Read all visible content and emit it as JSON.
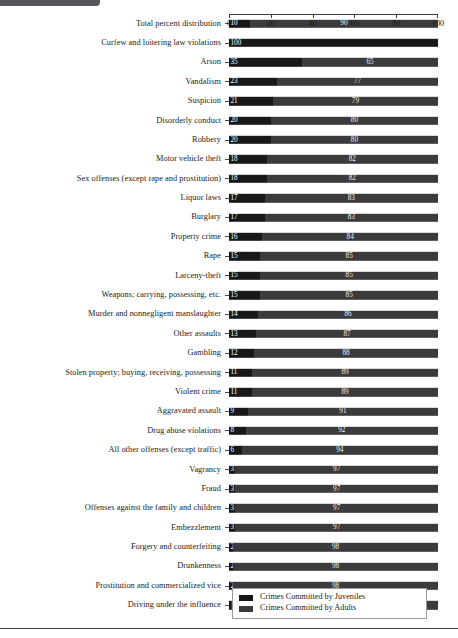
{
  "chart_data": {
    "type": "bar",
    "subtype": "stacked-horizontal-100percent",
    "title": "",
    "xlabel": "",
    "ylabel": "",
    "xlim": [
      0,
      100
    ],
    "xticks": [
      0,
      20,
      40,
      60,
      80,
      100
    ],
    "xtick_labels": [
      "0",
      "20",
      "40",
      "60",
      "80",
      "100"
    ],
    "grid": false,
    "legend_position": "bottom-right",
    "legend": [
      "Crimes Committed by Juveniles",
      "Crimes Committed by Adults"
    ],
    "series": [
      {
        "name": "Crimes Committed by Juveniles",
        "color": "#18181a"
      },
      {
        "name": "Crimes Committed by Adults",
        "color": "#3b3b3d"
      }
    ],
    "categories": [
      "Total percent distribution",
      "Curfew and loitering law violations",
      "Arson",
      "Vandalism",
      "Suspicion",
      "Disorderly conduct",
      "Robbery",
      "Motor vehicle theft",
      "Sex offenses (except rape and prostitution)",
      "Liquor laws",
      "Burglary",
      "Property crime",
      "Rape",
      "Larceny-theft",
      "Weapons; carrying, possessing, etc.",
      "Murder and nonnegligent manslaughter",
      "Other assaults",
      "Gambling",
      "Stolen property; buying, receiving, possessing",
      "Violent crime",
      "Aggravated assault",
      "Drug abuse violations",
      "All other offenses (except traffic)",
      "Vagrancy",
      "Fraud",
      "Offenses against the family and children",
      "Embezzlement",
      "Forgery and counterfeiting",
      "Drunkenness",
      "Prostitution and commercialized vice",
      "Driving under the influence"
    ],
    "rows": [
      {
        "label": "Total percent distribution",
        "juvenile": 10,
        "adult": 90
      },
      {
        "label": "Curfew and loitering law violations",
        "juvenile": 100,
        "adult": 0
      },
      {
        "label": "Arson",
        "juvenile": 35,
        "adult": 65
      },
      {
        "label": "Vandalism",
        "juvenile": 23,
        "adult": 77
      },
      {
        "label": "Suspicion",
        "juvenile": 21,
        "adult": 79
      },
      {
        "label": "Disorderly conduct",
        "juvenile": 20,
        "adult": 80
      },
      {
        "label": "Robbery",
        "juvenile": 20,
        "adult": 80
      },
      {
        "label": "Motor vehicle theft",
        "juvenile": 18,
        "adult": 82
      },
      {
        "label": "Sex offenses (except rape and prostitution)",
        "juvenile": 18,
        "adult": 82
      },
      {
        "label": "Liquor laws",
        "juvenile": 17,
        "adult": 83
      },
      {
        "label": "Burglary",
        "juvenile": 17,
        "adult": 83
      },
      {
        "label": "Property crime",
        "juvenile": 16,
        "adult": 84
      },
      {
        "label": "Rape",
        "juvenile": 15,
        "adult": 85
      },
      {
        "label": "Larceny-theft",
        "juvenile": 15,
        "adult": 85
      },
      {
        "label": "Weapons; carrying, possessing, etc.",
        "juvenile": 15,
        "adult": 85
      },
      {
        "label": "Murder and nonnegligent manslaughter",
        "juvenile": 14,
        "adult": 86
      },
      {
        "label": "Other assaults",
        "juvenile": 13,
        "adult": 87
      },
      {
        "label": "Gambling",
        "juvenile": 12,
        "adult": 88
      },
      {
        "label": "Stolen property; buying, receiving, possessing",
        "juvenile": 11,
        "adult": 89
      },
      {
        "label": "Violent crime",
        "juvenile": 11,
        "adult": 89
      },
      {
        "label": "Aggravated assault",
        "juvenile": 9,
        "adult": 91
      },
      {
        "label": "Drug abuse violations",
        "juvenile": 8,
        "adult": 92
      },
      {
        "label": "All other offenses (except traffic)",
        "juvenile": 6,
        "adult": 94
      },
      {
        "label": "Vagrancy",
        "juvenile": 3,
        "adult": 97
      },
      {
        "label": "Fraud",
        "juvenile": 3,
        "adult": 97
      },
      {
        "label": "Offenses against the family and children",
        "juvenile": 3,
        "adult": 97
      },
      {
        "label": "Embezzlement",
        "juvenile": 3,
        "adult": 97
      },
      {
        "label": "Forgery and counterfeiting",
        "juvenile": 2,
        "adult": 98
      },
      {
        "label": "Drunkenness",
        "juvenile": 2,
        "adult": 98
      },
      {
        "label": "Prostitution and commercialized vice",
        "juvenile": 2,
        "adult": 98
      },
      {
        "label": "Driving under the influence",
        "juvenile": 1,
        "adult": 99
      }
    ]
  }
}
